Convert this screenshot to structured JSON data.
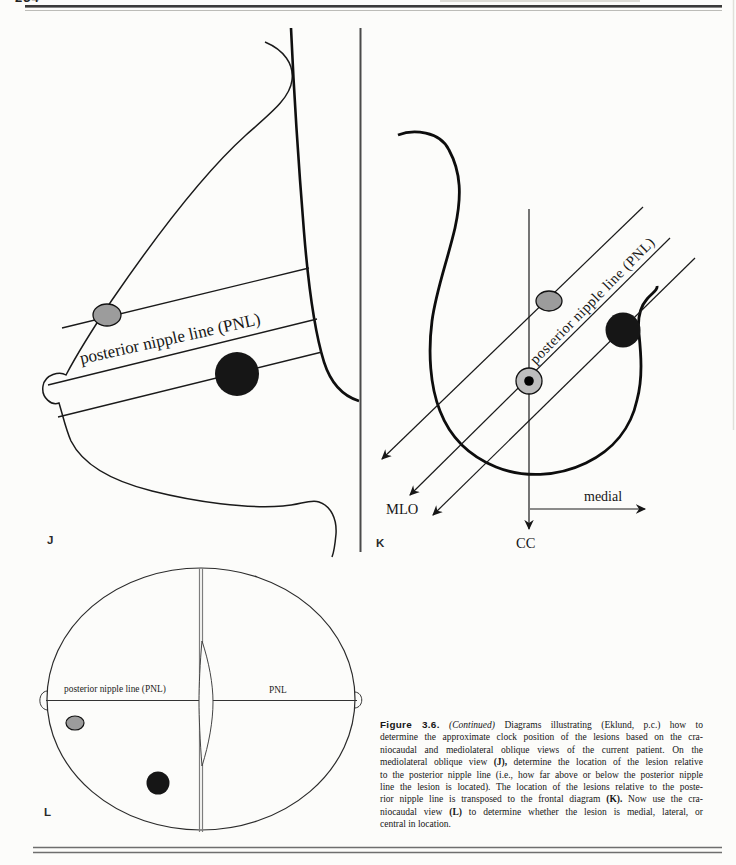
{
  "page": {
    "number": "234"
  },
  "colors": {
    "ink": "#1a1a1a",
    "gray_lesion": "#9c9c9c",
    "nipple_gray": "#bdbdbd",
    "black_lesion": "#161616",
    "divider": "#4a4a4a",
    "rule_gray": "#7d7d7d"
  },
  "labels": {
    "j": "J",
    "k": "K",
    "l": "L",
    "mlo": "MLO",
    "cc": "CC",
    "medial": "medial"
  },
  "pnl": {
    "j_text": "posterior nipple line (PNL)",
    "k_text": "posterior nipple line (PNL)",
    "l_left": "posterior nipple line (PNL)",
    "l_right": "PNL"
  },
  "caption": {
    "lines": [
      [
        {
          "t": "Figure 3.6.",
          "s": "fig"
        },
        {
          "t": " ",
          "s": "n"
        },
        {
          "t": "(Continued)",
          "s": "i"
        },
        {
          "t": " Diagrams illustrating (Eklund, p.c.) how to",
          "s": "n"
        }
      ],
      [
        {
          "t": "determine the approximate clock position of the lesions based on the cra-",
          "s": "n"
        }
      ],
      [
        {
          "t": "niocaudal and mediolateral oblique views of the current patient. On the",
          "s": "n"
        }
      ],
      [
        {
          "t": "mediolateral oblique view ",
          "s": "n"
        },
        {
          "t": "(J),",
          "s": "b"
        },
        {
          "t": " determine the location of the lesion relative",
          "s": "n"
        }
      ],
      [
        {
          "t": "to the posterior nipple line (i.e., how far above or below the posterior nipple",
          "s": "n"
        }
      ],
      [
        {
          "t": "line the lesion is located). The location of the lesions relative to the poste-",
          "s": "n"
        }
      ],
      [
        {
          "t": "rior nipple line is transposed to the frontal diagram ",
          "s": "n"
        },
        {
          "t": "(K).",
          "s": "b"
        },
        {
          "t": " Now use the cra-",
          "s": "n"
        }
      ],
      [
        {
          "t": "niocaudal view ",
          "s": "n"
        },
        {
          "t": "(L)",
          "s": "b"
        },
        {
          "t": " to determine whether the lesion is medial, lateral, or",
          "s": "n"
        }
      ],
      [
        {
          "t": "central in location.",
          "s": "n"
        }
      ]
    ]
  }
}
